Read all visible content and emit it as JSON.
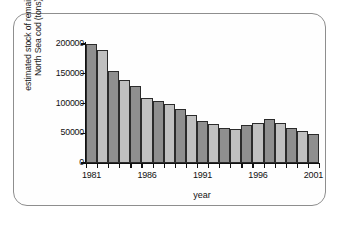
{
  "chart_data": {
    "type": "bar",
    "title": "",
    "xlabel": "year",
    "ylabel": "estimated stock of remaining North Sea cod (tons)",
    "ylabel_lines": [
      "estimated stock of remaining",
      "North Sea cod (tons)"
    ],
    "categories": [
      1981,
      1982,
      1983,
      1984,
      1985,
      1986,
      1987,
      1988,
      1989,
      1990,
      1991,
      1992,
      1993,
      1994,
      1995,
      1996,
      1997,
      1998,
      1999,
      2000,
      2001
    ],
    "values": [
      200000,
      190000,
      155000,
      140000,
      129000,
      110000,
      105000,
      100000,
      90000,
      80000,
      70000,
      65000,
      59000,
      58000,
      64000,
      68000,
      74000,
      68000,
      59000,
      54000,
      49000
    ],
    "ylim": [
      0,
      200000
    ],
    "yticks": [
      0,
      50000,
      100000,
      150000,
      200000
    ],
    "ytick_labels": [
      "0",
      "50000",
      "100000",
      "150000",
      "200000"
    ],
    "xticks": [
      1981,
      1986,
      1991,
      1996,
      2001
    ],
    "xtick_labels": [
      "1981",
      "1986",
      "1991",
      "1996",
      "2001"
    ],
    "grid": false,
    "legend": null,
    "bar_colors_alternating": [
      "#8f8f8f",
      "#c0c0c0"
    ],
    "bar_edge_color": "#2b2b2b"
  },
  "frame": {
    "border_color": "#8e8e8e",
    "background": "#ffffff"
  }
}
